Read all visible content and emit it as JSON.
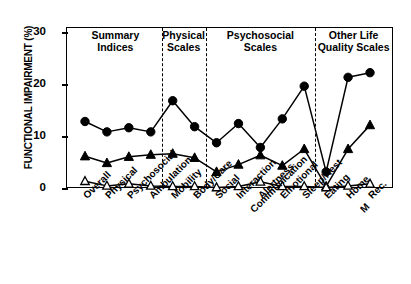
{
  "chart_data": {
    "type": "line",
    "title": "",
    "xlabel": "",
    "ylabel": "FUNCTIONAL IMPAIRMENT (%)",
    "ylim": [
      0,
      31
    ],
    "yticks": [
      0,
      10,
      20,
      30
    ],
    "ytick_labels": [
      "0",
      "10",
      "20",
      "30"
    ],
    "grid": false,
    "legend_position": "none",
    "categories": [
      "Overall",
      "Physical",
      "Psychosocial",
      "Ambulation",
      "Mobility",
      "Body/Care",
      "Social",
      "Interaction Communication",
      "Alertness",
      "Emotional",
      "Sleep/Rest",
      "Eating",
      "Home M",
      "Rec."
    ],
    "series": [
      {
        "name": "filled-circle",
        "marker": "filled-circle",
        "values": [
          13.0,
          11.0,
          11.8,
          11.0,
          17.0,
          12.0,
          8.9,
          12.6,
          8.0,
          13.5,
          19.8,
          3.3,
          21.5,
          22.4
        ]
      },
      {
        "name": "filled-triangle",
        "marker": "filled-triangle",
        "values": [
          6.3,
          5.0,
          6.2,
          6.6,
          6.8,
          6.0,
          3.3,
          4.7,
          6.5,
          4.5,
          7.7,
          0.5,
          7.7,
          12.3
        ]
      },
      {
        "name": "open-triangle",
        "marker": "open-triangle",
        "values": [
          1.5,
          0.6,
          1.0,
          0.6,
          0.5,
          0.5,
          0.3,
          0.5,
          1.4,
          0.5,
          0.5,
          0.3,
          0.6,
          1.0
        ]
      }
    ],
    "groups": [
      {
        "label_line1": "Summary",
        "label_line2": "Indices",
        "start_index": 0,
        "end_index": 3
      },
      {
        "label_line1": "Physical",
        "label_line2": "Scales",
        "start_index": 4,
        "end_index": 5
      },
      {
        "label_line1": "Psychosocial",
        "label_line2": "Scales",
        "start_index": 6,
        "end_index": 10
      },
      {
        "label_line1": "Other Life",
        "label_line2": "Quality Scales",
        "start_index": 11,
        "end_index": 13
      }
    ],
    "dividers_after_index": [
      3,
      5,
      10
    ],
    "colors": {
      "axis": "#000000",
      "series_filled": "#000000",
      "series_open_fill": "#ffffff",
      "series_open_stroke": "#000000",
      "background": "#ffffff"
    }
  }
}
